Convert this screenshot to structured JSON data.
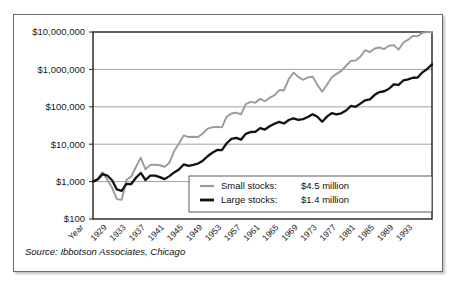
{
  "figure": {
    "source_note": "Source: Ibbotson Associates, Chicago",
    "frame_color": "#6b6b6b",
    "background": "#ffffff"
  },
  "legend": {
    "position": "bottom-right",
    "items": [
      {
        "label": "Small stocks:",
        "value": "$4.5 million",
        "color": "#9a9a9a",
        "name": "small-stocks"
      },
      {
        "label": "Large stocks:",
        "value": "$1.4 million",
        "color": "#111111",
        "name": "large-stocks"
      }
    ]
  },
  "chart_data": {
    "type": "line",
    "title": "",
    "xlabel": "Year",
    "ylabel": "",
    "yscale": "log",
    "ylim": [
      100,
      10000000
    ],
    "grid": true,
    "ytick_labels": [
      "$10,000,000",
      "$1,000,000",
      "$100,000",
      "$10,000",
      "$1,000",
      "$100"
    ],
    "ytick_values": [
      10000000,
      1000000,
      100000,
      10000,
      1000,
      100
    ],
    "xtick_labels": [
      "Year",
      "1929",
      "1933",
      "1937",
      "1941",
      "1945",
      "1949",
      "1953",
      "1957",
      "1961",
      "1965",
      "1969",
      "1973",
      "1977",
      "1981",
      "1985",
      "1989",
      "1993"
    ],
    "x": [
      1926,
      1927,
      1928,
      1929,
      1930,
      1931,
      1932,
      1933,
      1934,
      1935,
      1936,
      1937,
      1938,
      1939,
      1940,
      1941,
      1942,
      1943,
      1944,
      1945,
      1946,
      1947,
      1948,
      1949,
      1950,
      1951,
      1952,
      1953,
      1954,
      1955,
      1956,
      1957,
      1958,
      1959,
      1960,
      1961,
      1962,
      1963,
      1964,
      1965,
      1966,
      1967,
      1968,
      1969,
      1970,
      1971,
      1972,
      1973,
      1974,
      1975,
      1976,
      1977,
      1978,
      1979,
      1980,
      1981,
      1982,
      1983,
      1984,
      1985,
      1986,
      1987,
      1988,
      1989,
      1990,
      1991,
      1992,
      1993,
      1994,
      1995,
      1996,
      1997
    ],
    "series": [
      {
        "name": "Small stocks",
        "color": "#9a9a9a",
        "end_value_label": "$4.5 million",
        "values": [
          1000,
          1222,
          1784,
          1119,
          681,
          341,
          324,
          1102,
          1368,
          2462,
          4371,
          2127,
          2800,
          2840,
          2735,
          2497,
          3205,
          6573,
          10310,
          17190,
          15510,
          15840,
          15480,
          19310,
          26180,
          28230,
          29190,
          28200,
          54400,
          66050,
          69760,
          63090,
          117900,
          135100,
          128400,
          163200,
          140800,
          174900,
          203000,
          281000,
          273000,
          547000,
          823000,
          630000,
          527000,
          611000,
          636000,
          385000,
          253000,
          388000,
          614000,
          760000,
          912000,
          1253000,
          1690000,
          1732000,
          2188000,
          3263000,
          2910000,
          3630000,
          3850000,
          3490000,
          4300000,
          4450000,
          3370000,
          5220000,
          6240000,
          7890000,
          7690000,
          9520000,
          10900000,
          12200000
        ],
        "values_note": "cumulative value of $1,000 invested end-1925; chart terminates at $4.5 million"
      },
      {
        "name": "Large stocks",
        "color": "#111111",
        "end_value_label": "$1.4 million",
        "values": [
          1000,
          1137,
          1584,
          1452,
          1090,
          617,
          567,
          872,
          860,
          1271,
          1702,
          1105,
          1447,
          1440,
          1315,
          1163,
          1399,
          1762,
          2110,
          2877,
          2646,
          2798,
          3052,
          3621,
          4767,
          5913,
          6998,
          6932,
          10580,
          13900,
          14820,
          13230,
          18950,
          21210,
          21310,
          27010,
          24660,
          30290,
          35290,
          39690,
          35700,
          44250,
          49140,
          44960,
          46750,
          53410,
          63550,
          54220,
          39860,
          54700,
          67740,
          62900,
          67030,
          79430,
          105200,
          100000,
          121600,
          149000,
          158400,
          208600,
          247500,
          260500,
          303800,
          399900,
          387500,
          505500,
          544000,
          598700,
          606700,
          834600,
          1026000,
          1368000
        ],
        "values_note": "cumulative value of $1,000 invested end-1925; chart terminates at $1.4 million"
      }
    ]
  }
}
